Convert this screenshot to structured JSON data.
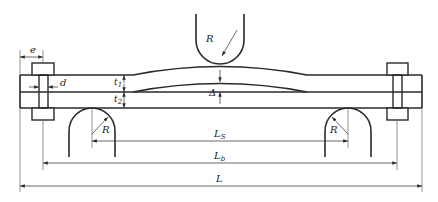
{
  "labels": {
    "e": "e",
    "d": "d",
    "t1_main": "t",
    "t1_sub": "1",
    "t2_main": "t",
    "t2_sub": "2",
    "delta": "Δ",
    "R_top": "R",
    "R_left": "R",
    "R_right": "R",
    "Ls_main": "L",
    "Ls_sub": "S",
    "Lb_main": "L",
    "Lb_sub": "b",
    "L": "L"
  },
  "colors": {
    "stroke": "#2a2a2a",
    "thin": "#555555",
    "background": "#ffffff"
  }
}
